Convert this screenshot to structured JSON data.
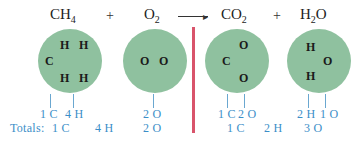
{
  "equation": {
    "reactants": [
      {
        "base": "CH",
        "sub": "4"
      },
      {
        "base": "O",
        "sub": "2"
      }
    ],
    "products": [
      {
        "base": "CO",
        "sub": "2"
      },
      {
        "pre": "H",
        "sub": "2",
        "post": "O"
      }
    ],
    "plus": "+",
    "arrow": "⟶"
  },
  "molecules": {
    "ch4": {
      "atoms": [
        "H",
        "H",
        "C",
        "H",
        "H"
      ],
      "counts": [
        "1 C",
        "4 H"
      ]
    },
    "o2": {
      "atoms": [
        "O",
        "O"
      ],
      "counts": [
        "2 O"
      ]
    },
    "co2": {
      "atoms": [
        "O",
        "C",
        "O"
      ],
      "counts": [
        "1 C",
        "2 O"
      ]
    },
    "h2o": {
      "atoms": [
        "H",
        "O",
        "H"
      ],
      "counts": [
        "2 H",
        "1 O"
      ]
    }
  },
  "totals": {
    "label": "Totals:",
    "reactants": [
      "1 C",
      "4 H",
      "2 O"
    ],
    "products": [
      "1 C",
      "2 H",
      "3 O"
    ]
  },
  "colors": {
    "circle": "#8fc19f",
    "count_text": "#3b8ec8",
    "divider": "#d9546b"
  }
}
